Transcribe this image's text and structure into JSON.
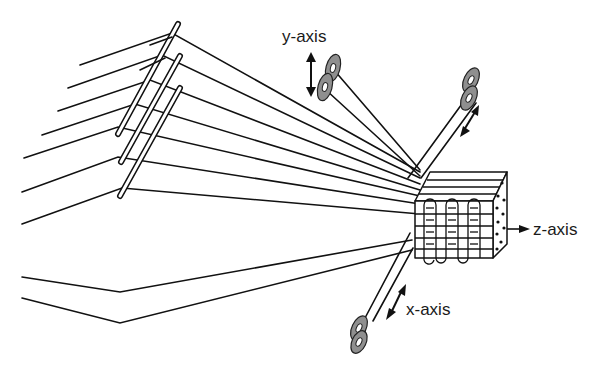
{
  "diagram": {
    "type": "3D weaving schematic",
    "labels": {
      "y_axis": "y-axis",
      "x_axis": "x-axis",
      "z_axis": "z-axis"
    },
    "colors": {
      "line": "#111111",
      "bobbin_fill": "#8f8f8f",
      "background": "#ffffff"
    },
    "components": [
      {
        "id": "warp-yarns",
        "desc": "Warp yarn layers converging into fabric"
      },
      {
        "id": "heddles",
        "count": 3,
        "desc": "Slanted heddle bars crossing warp yarns"
      },
      {
        "id": "y-bobbins",
        "count": 2,
        "desc": "Bobbins inserting yarns along y-axis"
      },
      {
        "id": "upper-bobbins",
        "count": 2,
        "desc": "Bobbins feeding yarns from upper right"
      },
      {
        "id": "x-bobbins",
        "count": 2,
        "desc": "Bobbins inserting yarns along x-axis"
      },
      {
        "id": "fabric-block",
        "desc": "3D woven preform with looped z-yarns"
      }
    ]
  }
}
